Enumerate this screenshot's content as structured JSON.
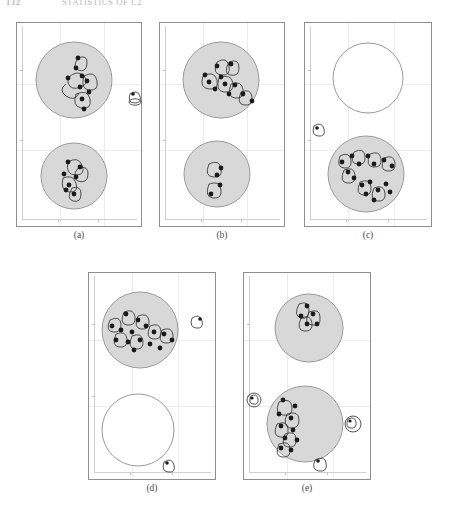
{
  "page": {
    "running_head_folio": "132",
    "running_head_title": "STATISTICS OF L2",
    "background_color": "#ffffff",
    "ink_color": "#111111"
  },
  "figure": {
    "circle_fill_gray": "#d8d8d8",
    "circle_fill_empty": "#ffffff",
    "circle_stroke": "#9a9a9a",
    "dot_color": "#1a1a1a",
    "loop_stroke": "#2b2b2b",
    "frame_stroke": "#8f8f8f",
    "axis_stroke": "#cfcfcf",
    "panels": [
      {
        "id": "a",
        "caption": "(a)",
        "top_circle_state": "filled",
        "bottom_circle_state": "filled",
        "top_cluster_count": 9,
        "bottom_cluster_count": 7,
        "outside_marker_count": 1,
        "outside_markers": [
          "right-middle"
        ]
      },
      {
        "id": "b",
        "caption": "(b)",
        "top_circle_state": "filled",
        "bottom_circle_state": "filled",
        "top_cluster_count": 11,
        "bottom_cluster_count": 4,
        "outside_marker_count": 0,
        "outside_markers": []
      },
      {
        "id": "c",
        "caption": "(c)",
        "top_circle_state": "empty",
        "bottom_circle_state": "filled",
        "top_cluster_count": 0,
        "bottom_cluster_count": 16,
        "outside_marker_count": 1,
        "outside_markers": [
          "left-middle"
        ]
      },
      {
        "id": "d",
        "caption": "(d)",
        "top_circle_state": "filled",
        "bottom_circle_state": "empty",
        "top_cluster_count": 15,
        "bottom_cluster_count": 0,
        "outside_marker_count": 2,
        "outside_markers": [
          "right-upper",
          "bottom-right"
        ]
      },
      {
        "id": "e",
        "caption": "(e)",
        "top_circle_state": "filled",
        "bottom_circle_state": "filled",
        "top_cluster_count": 5,
        "bottom_cluster_count": 10,
        "outside_marker_count": 3,
        "outside_markers": [
          "left-middle",
          "right-middle",
          "bottom-center"
        ]
      }
    ]
  }
}
